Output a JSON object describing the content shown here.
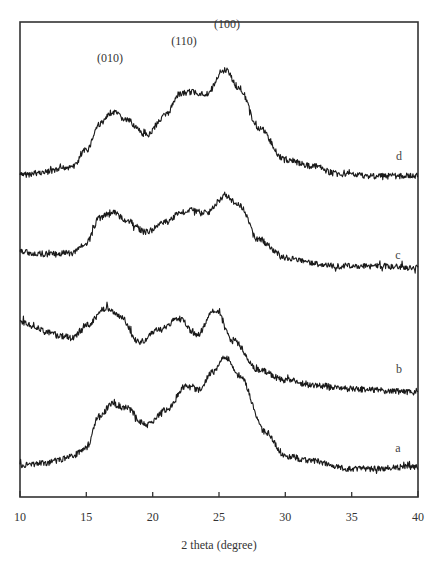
{
  "chart_data": {
    "type": "line",
    "title": "",
    "xlabel": "2 theta (degree)",
    "ylabel": "",
    "xlim": [
      10,
      40
    ],
    "x_ticks": [
      10,
      15,
      20,
      25,
      30,
      35,
      40
    ],
    "x_tick_labels": [
      "10",
      "15",
      "20",
      "25",
      "30",
      "35",
      "40"
    ],
    "y_ticks": [],
    "grid": false,
    "legend": "inline labels at right end of each curve",
    "annotations": [
      {
        "text": "(010)",
        "x": 16.9,
        "series": "d"
      },
      {
        "text": "(110)",
        "x": 22.8,
        "series": "d"
      },
      {
        "text": "(100)",
        "x": 25.2,
        "series": "d"
      }
    ],
    "series": [
      {
        "name": "d",
        "note": "stacked / offset XRD pattern, arbitrary intensity units",
        "x": [
          10,
          12,
          14,
          15,
          16,
          17,
          18,
          19.5,
          21,
          22,
          23,
          24,
          25.5,
          26.5,
          28,
          30,
          32,
          34,
          37,
          40
        ],
        "values": [
          175,
          172,
          166,
          150,
          124,
          112,
          120,
          135,
          115,
          94,
          92,
          94,
          70,
          88,
          128,
          160,
          166,
          174,
          176,
          176
        ]
      },
      {
        "name": "c",
        "x": [
          10,
          12,
          14,
          15,
          16,
          17,
          18,
          19.5,
          21,
          22,
          23,
          24,
          25.5,
          26.5,
          28,
          30,
          32,
          34,
          37,
          40
        ],
        "values": [
          252,
          254,
          253,
          243,
          218,
          212,
          220,
          232,
          222,
          213,
          210,
          213,
          196,
          205,
          240,
          258,
          263,
          266,
          266,
          268
        ]
      },
      {
        "name": "b",
        "x": [
          10,
          11,
          12,
          13,
          14,
          15,
          16.5,
          17.5,
          19,
          20.5,
          22,
          23.3,
          24.7,
          26,
          28,
          30,
          32,
          35,
          40
        ],
        "values": [
          322,
          326,
          332,
          336,
          337,
          325,
          308,
          316,
          342,
          330,
          318,
          335,
          310,
          340,
          370,
          380,
          385,
          389,
          392
        ]
      },
      {
        "name": "a",
        "x": [
          10,
          12,
          13,
          14,
          15,
          16,
          17,
          18,
          19.5,
          21,
          22.5,
          23.5,
          24.5,
          25.5,
          26.5,
          28.5,
          30,
          32,
          35,
          40
        ],
        "values": [
          465,
          463,
          460,
          455,
          448,
          415,
          404,
          408,
          425,
          410,
          386,
          390,
          372,
          357,
          375,
          432,
          456,
          461,
          469,
          467
        ]
      }
    ]
  },
  "labels": {
    "xlabel": "2 theta (degree)",
    "ticks": [
      "10",
      "15",
      "20",
      "25",
      "30",
      "35",
      "40"
    ],
    "peak_010": "(010)",
    "peak_110": "(110)",
    "peak_100": "(100)",
    "series_a": "a",
    "series_b": "b",
    "series_c": "c",
    "series_d": "d"
  }
}
